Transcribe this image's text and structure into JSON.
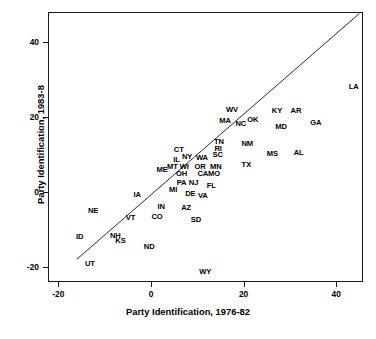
{
  "chart_data": {
    "type": "scatter",
    "title": "",
    "xlabel": "Party Identification, 1976-82",
    "ylabel": "Party Identification, 1983-8",
    "xlim": [
      -23.0,
      45.0
    ],
    "ylim": [
      -24.5,
      47.5
    ],
    "xticks": [
      -20,
      0,
      20,
      40
    ],
    "yticks": [
      -20,
      0,
      20,
      40
    ],
    "xticklabels": [
      "-20",
      "0",
      "20",
      "40"
    ],
    "yticklabels": [
      "-20",
      "0",
      "20",
      "40"
    ],
    "grid": false,
    "legend": null,
    "point_marker": "text-label",
    "annotations": [
      {
        "label": "LA",
        "x": 43.8,
        "y": 27.9
      },
      {
        "label": "KY",
        "x": 27.2,
        "y": 21.4
      },
      {
        "label": "AR",
        "x": 31.3,
        "y": 21.4
      },
      {
        "label": "WV",
        "x": 17.5,
        "y": 21.7
      },
      {
        "label": "GA",
        "x": 35.6,
        "y": 18.4
      },
      {
        "label": "MA",
        "x": 16.0,
        "y": 18.9
      },
      {
        "label": "NC",
        "x": 19.4,
        "y": 18.1
      },
      {
        "label": "OK",
        "x": 22.0,
        "y": 19.2
      },
      {
        "label": "MD",
        "x": 28.1,
        "y": 17.3
      },
      {
        "label": "TN",
        "x": 14.7,
        "y": 13.3
      },
      {
        "label": "NM",
        "x": 20.8,
        "y": 12.8
      },
      {
        "label": "RI",
        "x": 14.5,
        "y": 11.5
      },
      {
        "label": "CT",
        "x": 6.0,
        "y": 11.2
      },
      {
        "label": "AL",
        "x": 31.9,
        "y": 10.4
      },
      {
        "label": "MS",
        "x": 26.2,
        "y": 10.1
      },
      {
        "label": "SC",
        "x": 14.4,
        "y": 9.9
      },
      {
        "label": "NY",
        "x": 7.8,
        "y": 9.3
      },
      {
        "label": "WA",
        "x": 11.0,
        "y": 9.1
      },
      {
        "label": "IL",
        "x": 5.5,
        "y": 8.5
      },
      {
        "label": "MT",
        "x": 4.6,
        "y": 6.7
      },
      {
        "label": "WI",
        "x": 7.2,
        "y": 6.7
      },
      {
        "label": "OR",
        "x": 10.6,
        "y": 6.7
      },
      {
        "label": "MN",
        "x": 14.0,
        "y": 6.7
      },
      {
        "label": "TX",
        "x": 20.6,
        "y": 7.2
      },
      {
        "label": "ME",
        "x": 2.4,
        "y": 5.9
      },
      {
        "label": "OH",
        "x": 6.6,
        "y": 4.8
      },
      {
        "label": "CA",
        "x": 11.2,
        "y": 4.6
      },
      {
        "label": "MO",
        "x": 13.6,
        "y": 4.8
      },
      {
        "label": "PA",
        "x": 6.6,
        "y": 2.4
      },
      {
        "label": "NJ",
        "x": 9.2,
        "y": 2.4
      },
      {
        "label": "FL",
        "x": 13.0,
        "y": 1.6
      },
      {
        "label": "MI",
        "x": 4.8,
        "y": 0.5
      },
      {
        "label": "DE",
        "x": 8.5,
        "y": -0.6
      },
      {
        "label": "VA",
        "x": 11.2,
        "y": -1.2
      },
      {
        "label": "IA",
        "x": -3.0,
        "y": -0.8
      },
      {
        "label": "IN",
        "x": 2.2,
        "y": -4.1
      },
      {
        "label": "AZ",
        "x": 7.6,
        "y": -4.3
      },
      {
        "label": "NE",
        "x": -12.5,
        "y": -5.1
      },
      {
        "label": "CO",
        "x": 1.3,
        "y": -6.7
      },
      {
        "label": "VT",
        "x": -4.4,
        "y": -6.9
      },
      {
        "label": "SD",
        "x": 9.7,
        "y": -7.5
      },
      {
        "label": "ID",
        "x": -15.4,
        "y": -12.0
      },
      {
        "label": "NH",
        "x": -7.7,
        "y": -11.7
      },
      {
        "label": "KS",
        "x": -6.6,
        "y": -13.1
      },
      {
        "label": "ND",
        "x": -0.4,
        "y": -14.7
      },
      {
        "label": "UT",
        "x": -13.2,
        "y": -19.2
      },
      {
        "label": "WY",
        "x": 11.7,
        "y": -21.5
      }
    ],
    "reference_line": {
      "type": "identity",
      "description": "y = x diagonal line",
      "from": [
        -16.0,
        -18.0
      ],
      "to": [
        45.0,
        47.5
      ]
    }
  },
  "colors": {
    "background": "#ffffff",
    "axis": "#1a1a1a",
    "text": "#000000",
    "line": "#2b2b2b"
  }
}
